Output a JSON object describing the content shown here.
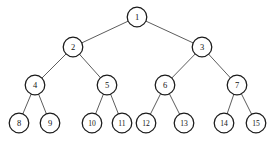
{
  "figure": {
    "background_color": "#ffffff",
    "node_fill": "#ffffff",
    "node_stroke": "#1a1a1a",
    "edge_color": "#4a4a4a",
    "label_color": "#111111",
    "width": 274,
    "height": 145
  },
  "chart_data": {
    "type": "diagram",
    "diagram_type": "binary-tree",
    "levels": 4,
    "node_count": 15,
    "node_radius": 9.8,
    "nodes": [
      {
        "id": 1,
        "label": "1",
        "level": 0,
        "x": 137,
        "y": 17,
        "r": 9.8
      },
      {
        "id": 2,
        "label": "2",
        "level": 1,
        "x": 73,
        "y": 47,
        "r": 9.8
      },
      {
        "id": 3,
        "label": "3",
        "level": 1,
        "x": 202,
        "y": 47,
        "r": 9.8
      },
      {
        "id": 4,
        "label": "4",
        "level": 2,
        "x": 35,
        "y": 85,
        "r": 9.8
      },
      {
        "id": 5,
        "label": "5",
        "level": 2,
        "x": 107,
        "y": 85,
        "r": 9.8
      },
      {
        "id": 6,
        "label": "6",
        "level": 2,
        "x": 165,
        "y": 85,
        "r": 9.8
      },
      {
        "id": 7,
        "label": "7",
        "level": 2,
        "x": 237,
        "y": 85,
        "r": 9.8
      },
      {
        "id": 8,
        "label": "8",
        "level": 3,
        "x": 19,
        "y": 123,
        "r": 9.8
      },
      {
        "id": 9,
        "label": "9",
        "level": 3,
        "x": 50,
        "y": 123,
        "r": 9.8
      },
      {
        "id": 10,
        "label": "10",
        "level": 3,
        "x": 92,
        "y": 123,
        "r": 9.8
      },
      {
        "id": 11,
        "label": "11",
        "level": 3,
        "x": 122,
        "y": 123,
        "r": 9.8
      },
      {
        "id": 12,
        "label": "12",
        "level": 3,
        "x": 146,
        "y": 123,
        "r": 9.8
      },
      {
        "id": 13,
        "label": "13",
        "level": 3,
        "x": 184,
        "y": 123,
        "r": 9.8
      },
      {
        "id": 14,
        "label": "14",
        "level": 3,
        "x": 224,
        "y": 123,
        "r": 9.8
      },
      {
        "id": 15,
        "label": "15",
        "level": 3,
        "x": 256,
        "y": 123,
        "r": 9.8
      }
    ],
    "edges": [
      {
        "from": 1,
        "to": 2
      },
      {
        "from": 1,
        "to": 3
      },
      {
        "from": 2,
        "to": 4
      },
      {
        "from": 2,
        "to": 5
      },
      {
        "from": 3,
        "to": 6
      },
      {
        "from": 3,
        "to": 7
      },
      {
        "from": 4,
        "to": 8
      },
      {
        "from": 4,
        "to": 9
      },
      {
        "from": 5,
        "to": 10
      },
      {
        "from": 5,
        "to": 11
      },
      {
        "from": 6,
        "to": 12
      },
      {
        "from": 6,
        "to": 13
      },
      {
        "from": 7,
        "to": 14
      },
      {
        "from": 7,
        "to": 15
      }
    ]
  }
}
